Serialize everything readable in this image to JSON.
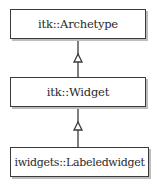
{
  "diagram": {
    "type": "uml-class-inheritance",
    "classes": [
      {
        "id": "archetype",
        "label": "itk::Archetype"
      },
      {
        "id": "widget",
        "label": "itk::Widget"
      },
      {
        "id": "labeledwidget",
        "label": "iwidgets::Labeledwidget"
      }
    ],
    "edges": [
      {
        "from": "widget",
        "to": "archetype",
        "type": "generalization"
      },
      {
        "from": "labeledwidget",
        "to": "widget",
        "type": "generalization"
      }
    ],
    "colors": {
      "border": "#3a3a3a",
      "shadow": "#bdbdbd",
      "text": "#2a2a2a"
    }
  }
}
